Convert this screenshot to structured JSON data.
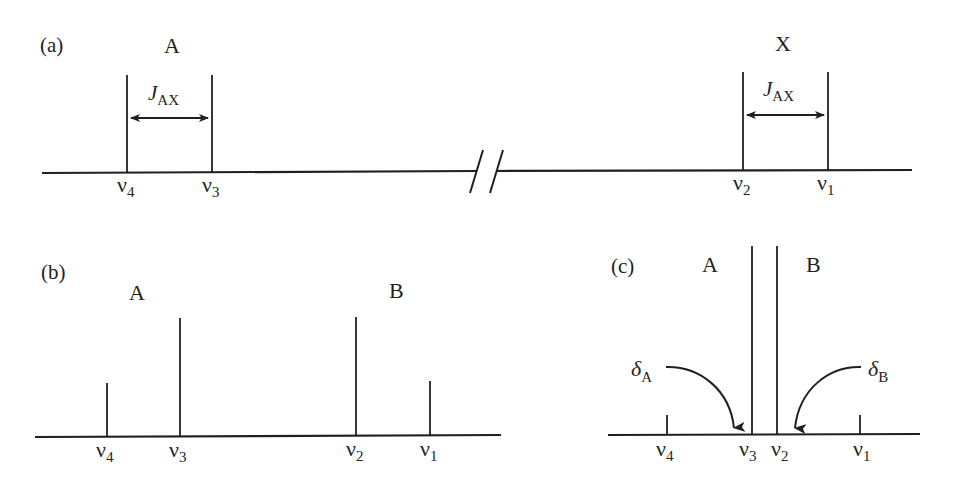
{
  "figure": {
    "ink_color": "#231f20",
    "background": "#ffffff"
  },
  "panels": {
    "a": {
      "label": "(a)",
      "nucleus_left": "A",
      "nucleus_right": "X",
      "coupling_left": {
        "symbol": "J",
        "subscript": "AX"
      },
      "coupling_right": {
        "symbol": "J",
        "subscript": "AX"
      },
      "axis_break": true,
      "lines": [
        {
          "name": "nu4",
          "symbol": "ν",
          "subscript": "4",
          "x": 127,
          "relative_height": 1.0
        },
        {
          "name": "nu3",
          "symbol": "ν",
          "subscript": "3",
          "x": 212,
          "relative_height": 1.0
        },
        {
          "name": "nu2",
          "symbol": "ν",
          "subscript": "2",
          "x": 743,
          "relative_height": 1.0
        },
        {
          "name": "nu1",
          "symbol": "ν",
          "subscript": "1",
          "x": 828,
          "relative_height": 1.0
        }
      ]
    },
    "b": {
      "label": "(b)",
      "nucleus_left": "A",
      "nucleus_right": "B",
      "lines": [
        {
          "name": "nu4",
          "symbol": "ν",
          "subscript": "4",
          "x": 107,
          "relative_height": 0.46
        },
        {
          "name": "nu3",
          "symbol": "ν",
          "subscript": "3",
          "x": 180,
          "relative_height": 1.0
        },
        {
          "name": "nu2",
          "symbol": "ν",
          "subscript": "2",
          "x": 356,
          "relative_height": 1.0
        },
        {
          "name": "nu1",
          "symbol": "ν",
          "subscript": "1",
          "x": 430,
          "relative_height": 0.46
        }
      ]
    },
    "c": {
      "label": "(c)",
      "nucleus_left": "A",
      "nucleus_right": "B",
      "shift_left": {
        "symbol": "δ",
        "subscript": "A"
      },
      "shift_right": {
        "symbol": "δ",
        "subscript": "B"
      },
      "lines": [
        {
          "name": "nu4",
          "symbol": "ν",
          "subscript": "4",
          "x": 667,
          "relative_height": 0.1
        },
        {
          "name": "nu3",
          "symbol": "ν",
          "subscript": "3",
          "x": 752,
          "relative_height": 1.0
        },
        {
          "name": "nu2",
          "symbol": "ν",
          "subscript": "2",
          "x": 777,
          "relative_height": 1.0
        },
        {
          "name": "nu1",
          "symbol": "ν",
          "subscript": "1",
          "x": 860,
          "relative_height": 0.1
        }
      ]
    }
  }
}
